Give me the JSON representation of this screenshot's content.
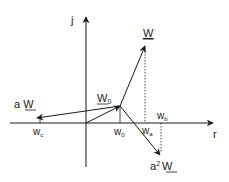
{
  "diagram": {
    "axes": {
      "vertical_label": "j",
      "horizontal_label": "r"
    },
    "vectors": {
      "W": {
        "base": "W",
        "underlined": true
      },
      "W0": {
        "base": "W",
        "sub": "0",
        "underlined": true
      },
      "aW": {
        "prefix": "a ",
        "base": "W",
        "underlined": true
      },
      "a2W": {
        "prefix": "a",
        "sup": "2",
        "base": "W",
        "underlined": true
      }
    },
    "axis_points": {
      "wc": {
        "base": "w",
        "sub": "c"
      },
      "w0": {
        "base": "w",
        "sub": "0"
      },
      "wa": {
        "base": "w",
        "sub": "a"
      },
      "wb": {
        "base": "w",
        "sub": "b"
      }
    },
    "colors": {
      "line": "#1a1a1a",
      "background": "#ffffff"
    }
  }
}
